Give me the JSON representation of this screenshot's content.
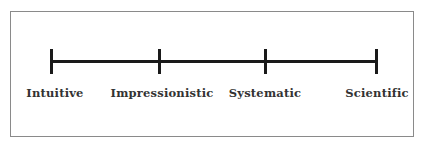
{
  "diagram": {
    "type": "continuum",
    "stages": [
      {
        "label": "Intuitive",
        "x": 52
      },
      {
        "label": "Impressionistic",
        "x": 160
      },
      {
        "label": "Systematic",
        "x": 266
      },
      {
        "label": "Scientific",
        "x": 376
      }
    ]
  }
}
